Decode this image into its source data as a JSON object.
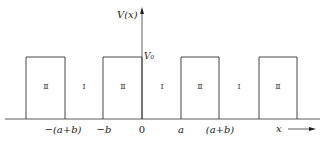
{
  "diagram": {
    "y_axis_label": "V(x)",
    "x_axis_label": "x",
    "barrier_height_label": "V₀",
    "barrier_region_label": "Ⅱ",
    "well_region_label": "Ⅰ",
    "regions": [
      "Ⅱ",
      "Ⅰ",
      "Ⅱ",
      "Ⅰ",
      "Ⅱ",
      "Ⅰ",
      "Ⅱ"
    ],
    "x_tick_labels": [
      "−(a+b)",
      "−b",
      "0",
      "a",
      "(a+b)"
    ],
    "colors": {
      "line": "#333333",
      "text": "#222222"
    }
  }
}
